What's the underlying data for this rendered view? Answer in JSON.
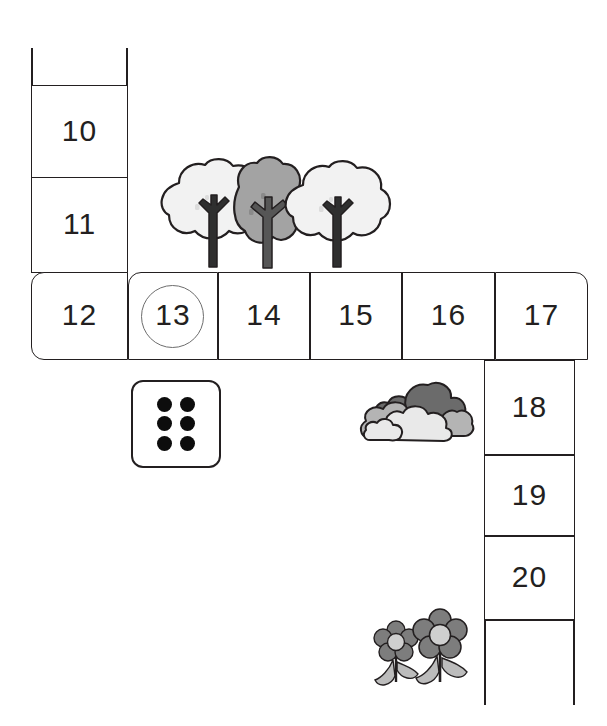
{
  "worksheet": {
    "type": "number-track-board-game",
    "colors": {
      "ink": "#231f20",
      "cell_fill": "#ffffff",
      "marker_ring": "#6d6d6d",
      "tree_light_foliage": "#f2f2f2",
      "tree_dark_foliage": "#a3a3a3",
      "tree_trunk_dark": "#2f2f2f",
      "tree_trunk_mid": "#565656",
      "bush_back": "#6b6b6b",
      "bush_mid": "#b4b4b4",
      "bush_front": "#e9e9e9",
      "flower_petal": "#7d7d7d",
      "flower_center": "#cfcfcf",
      "flower_leaf": "#bcbcbc",
      "die_pip": "#0d0d0d"
    }
  },
  "track": {
    "top_column_cells": [
      {
        "label": "10",
        "marked": false
      },
      {
        "label": "11",
        "marked": false
      }
    ],
    "middle_row_cells": [
      {
        "label": "12",
        "marked": false
      },
      {
        "label": "13",
        "marked": true
      },
      {
        "label": "14",
        "marked": false
      },
      {
        "label": "15",
        "marked": false
      },
      {
        "label": "16",
        "marked": false
      },
      {
        "label": "17",
        "marked": false
      }
    ],
    "right_column_cells": [
      {
        "label": "18",
        "marked": false
      },
      {
        "label": "19",
        "marked": false
      },
      {
        "label": "20",
        "marked": false
      }
    ],
    "marked_cell": "13"
  },
  "die": {
    "name": "six-sided-die",
    "value": 6,
    "pips": [
      true,
      true,
      true,
      true,
      true,
      true
    ]
  },
  "decorations": {
    "trees": [
      {
        "shade": "light"
      },
      {
        "shade": "dark"
      },
      {
        "shade": "light"
      }
    ],
    "bushes": {
      "count": 1,
      "label": "bush-cluster"
    },
    "flowers": [
      {
        "size": "small"
      },
      {
        "size": "large"
      }
    ]
  }
}
